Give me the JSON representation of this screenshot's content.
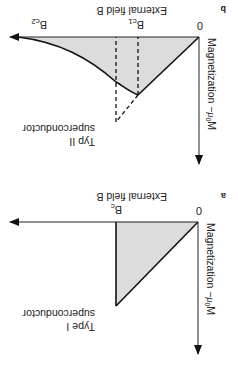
{
  "figure": {
    "orientation": "rotated-180",
    "panels": [
      {
        "id": "a",
        "panel_label": "a",
        "y_axis_label_main": "Magnetization −",
        "y_axis_label_sym": "μ",
        "y_axis_label_sub": "0",
        "y_axis_label_end": "M",
        "x_axis_label": "External field B",
        "origin_label": "0",
        "critical_field_label_main": "B",
        "critical_field_label_sub": "c",
        "type_label_line1": "Type I",
        "type_label_line2": "superconductor"
      },
      {
        "id": "b",
        "panel_label": "b",
        "y_axis_label_main": "Magnetization −",
        "y_axis_label_sym": "μ",
        "y_axis_label_sub": "0",
        "y_axis_label_end": "M",
        "x_axis_label": "External field B",
        "origin_label": "0",
        "bc1_label_main": "B",
        "bc1_label_sub": "c1",
        "bc2_label_main": "B",
        "bc2_label_sub": "c2",
        "type_label_line1": "Typ II",
        "type_label_line2": "superconductor"
      }
    ],
    "colors": {
      "line": "#111111",
      "shade": "#dcdcdc",
      "background": "#ffffff"
    }
  }
}
